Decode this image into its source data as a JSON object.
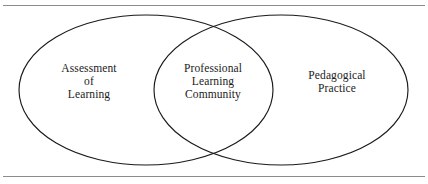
{
  "figure": {
    "kind": "venn-diagram",
    "background_color": "#ffffff",
    "stroke_color": "#1a1a1a",
    "text_color": "#1b1b1b",
    "rule_color": "#8c8c8c",
    "sets": [
      {
        "id": "assessment-of-learning",
        "label": "Assessment\nof\nLearning",
        "lines": [
          "Assessment",
          "of",
          "Learning"
        ],
        "position": "left"
      },
      {
        "id": "professional-learning-community",
        "label": "Professional\nLearning\nCommunity",
        "lines": [
          "Professional",
          "Learning",
          "Community"
        ],
        "position": "center-overlap"
      },
      {
        "id": "pedagogical-practice",
        "label": "Pedagogical\nPractice",
        "lines": [
          "Pedagogical",
          "Practice"
        ],
        "position": "right"
      }
    ],
    "rules": {
      "top": "horizontal-rule",
      "bottom": "horizontal-rule"
    }
  }
}
